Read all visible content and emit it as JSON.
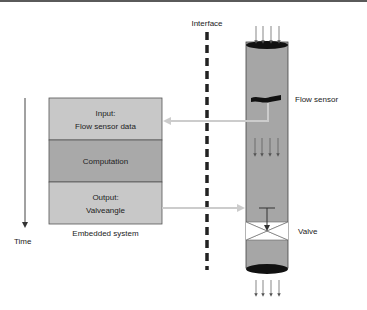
{
  "diagram": {
    "interface_label": "Interface",
    "time_label": "Time",
    "embedded_system": {
      "caption": "Embedded system",
      "blocks": [
        {
          "lines": [
            "Input:",
            "Flow sensor data"
          ],
          "color": "#c8c8c8"
        },
        {
          "lines": [
            "Computation"
          ],
          "color": "#a9a9a9"
        },
        {
          "lines": [
            "Output:",
            "Valveangle"
          ],
          "color": "#c8c8c8"
        }
      ]
    },
    "pipe": {
      "flow_sensor_label": "Flow sensor",
      "valve_label": "Valve",
      "body_color": "#a6a6a6",
      "end_color": "#111111"
    },
    "arrow_color": "#cccccc"
  }
}
